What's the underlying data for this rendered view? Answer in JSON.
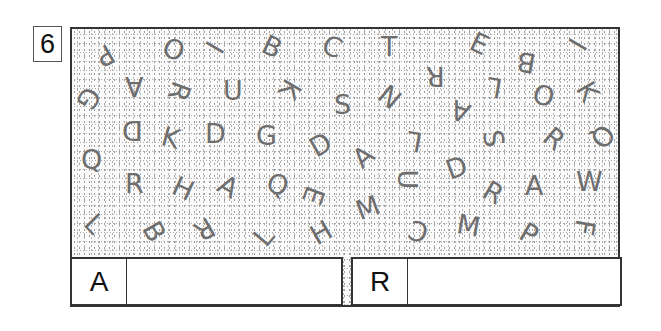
{
  "puzzle_number": "6",
  "letters": [
    {
      "ch": "P",
      "x": 106,
      "y": 56,
      "rot": 150
    },
    {
      "ch": "O",
      "x": 172,
      "y": 50,
      "rot": 20
    },
    {
      "ch": "I",
      "x": 220,
      "y": 48,
      "rot": -60
    },
    {
      "ch": "B",
      "x": 272,
      "y": 47,
      "rot": 25
    },
    {
      "ch": "C",
      "x": 332,
      "y": 47,
      "rot": 20
    },
    {
      "ch": "T",
      "x": 390,
      "y": 47,
      "rot": 0
    },
    {
      "ch": "E",
      "x": 480,
      "y": 44,
      "rot": 25
    },
    {
      "ch": "B",
      "x": 526,
      "y": 63,
      "rot": 190
    },
    {
      "ch": "I",
      "x": 583,
      "y": 45,
      "rot": -60
    },
    {
      "ch": "G",
      "x": 87,
      "y": 99,
      "rot": 120
    },
    {
      "ch": "A",
      "x": 134,
      "y": 87,
      "rot": 180
    },
    {
      "ch": "R",
      "x": 179,
      "y": 92,
      "rot": 110
    },
    {
      "ch": "U",
      "x": 232,
      "y": 91,
      "rot": 0
    },
    {
      "ch": "K",
      "x": 290,
      "y": 90,
      "rot": 120
    },
    {
      "ch": "S",
      "x": 343,
      "y": 105,
      "rot": 0
    },
    {
      "ch": "N",
      "x": 389,
      "y": 97,
      "rot": -140
    },
    {
      "ch": "R",
      "x": 435,
      "y": 77,
      "rot": 180
    },
    {
      "ch": "L",
      "x": 496,
      "y": 88,
      "rot": 190
    },
    {
      "ch": "O",
      "x": 542,
      "y": 96,
      "rot": 15
    },
    {
      "ch": "K",
      "x": 588,
      "y": 92,
      "rot": 60
    },
    {
      "ch": "A",
      "x": 460,
      "y": 112,
      "rot": 200
    },
    {
      "ch": "D",
      "x": 131,
      "y": 131,
      "rot": 180
    },
    {
      "ch": "K",
      "x": 171,
      "y": 138,
      "rot": 15
    },
    {
      "ch": "D",
      "x": 214,
      "y": 134,
      "rot": 0
    },
    {
      "ch": "G",
      "x": 265,
      "y": 136,
      "rot": 0
    },
    {
      "ch": "D",
      "x": 319,
      "y": 145,
      "rot": -30
    },
    {
      "ch": "A",
      "x": 363,
      "y": 157,
      "rot": -40
    },
    {
      "ch": "L",
      "x": 416,
      "y": 142,
      "rot": 190
    },
    {
      "ch": "S",
      "x": 494,
      "y": 139,
      "rot": 80
    },
    {
      "ch": "R",
      "x": 554,
      "y": 139,
      "rot": 40
    },
    {
      "ch": "Q",
      "x": 601,
      "y": 137,
      "rot": 130
    },
    {
      "ch": "Q",
      "x": 90,
      "y": 160,
      "rot": 0
    },
    {
      "ch": "R",
      "x": 134,
      "y": 184,
      "rot": 0
    },
    {
      "ch": "H",
      "x": 182,
      "y": 189,
      "rot": 25
    },
    {
      "ch": "A",
      "x": 228,
      "y": 187,
      "rot": 30
    },
    {
      "ch": "Q",
      "x": 276,
      "y": 185,
      "rot": 20
    },
    {
      "ch": "E",
      "x": 314,
      "y": 196,
      "rot": 110
    },
    {
      "ch": "U",
      "x": 407,
      "y": 180,
      "rot": 90
    },
    {
      "ch": "D",
      "x": 455,
      "y": 168,
      "rot": -20
    },
    {
      "ch": "R",
      "x": 493,
      "y": 193,
      "rot": 30
    },
    {
      "ch": "A",
      "x": 534,
      "y": 186,
      "rot": 0
    },
    {
      "ch": "W",
      "x": 585,
      "y": 182,
      "rot": 0
    },
    {
      "ch": "L",
      "x": 96,
      "y": 224,
      "rot": 45
    },
    {
      "ch": "B",
      "x": 154,
      "y": 232,
      "rot": 60
    },
    {
      "ch": "R",
      "x": 204,
      "y": 230,
      "rot": 150
    },
    {
      "ch": "L",
      "x": 265,
      "y": 237,
      "rot": -50
    },
    {
      "ch": "H",
      "x": 320,
      "y": 233,
      "rot": -30
    },
    {
      "ch": "M",
      "x": 365,
      "y": 208,
      "rot": -20
    },
    {
      "ch": "C",
      "x": 418,
      "y": 232,
      "rot": 200
    },
    {
      "ch": "M",
      "x": 466,
      "y": 226,
      "rot": 10
    },
    {
      "ch": "P",
      "x": 530,
      "y": 234,
      "rot": 30
    },
    {
      "ch": "F",
      "x": 586,
      "y": 228,
      "rot": 100
    }
  ],
  "answers": [
    {
      "label": "A",
      "value": ""
    },
    {
      "label": "R",
      "value": ""
    }
  ]
}
